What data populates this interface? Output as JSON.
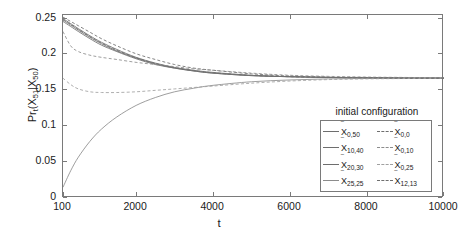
{
  "axes": {
    "xlabel": "t",
    "ylabel_parts": {
      "prefix": "Pr",
      "prefix_sub": "t",
      "open": "(X",
      "n1": "51",
      "bar": "|X",
      "n2": "50",
      "close": ")"
    },
    "ylabel_plain": "Pr_t(X_51|X_50)",
    "xticks": [
      "100",
      "2000",
      "4000",
      "6000",
      "8000",
      "10000"
    ],
    "yticks": [
      "0",
      "0.05",
      "0.1",
      "0.15",
      "0.2",
      "0.25"
    ]
  },
  "legend": {
    "title": "initial configuration",
    "entries": [
      {
        "label": "X",
        "sub": "0,50",
        "style": "solid",
        "color": "#6e6e6e",
        "col": 0,
        "row": 0
      },
      {
        "label": "X",
        "sub": "10,40",
        "style": "solid",
        "color": "#6e6e6e",
        "col": 0,
        "row": 1
      },
      {
        "label": "X",
        "sub": "20,30",
        "style": "solid",
        "color": "#6e6e6e",
        "col": 0,
        "row": 2
      },
      {
        "label": "X",
        "sub": "25,25",
        "style": "solid",
        "color": "#8c8c8c",
        "col": 0,
        "row": 3
      },
      {
        "label": "X",
        "sub": "0,0",
        "style": "dashed",
        "color": "#6e6e6e",
        "col": 1,
        "row": 0
      },
      {
        "label": "X",
        "sub": "0,10",
        "style": "dashed",
        "color": "#8c8c8c",
        "col": 1,
        "row": 1
      },
      {
        "label": "X",
        "sub": "0,25",
        "style": "dashed",
        "color": "#a0a0a0",
        "col": 1,
        "row": 2
      },
      {
        "label": "X",
        "sub": "12,13",
        "style": "dashed",
        "color": "#6e6e6e",
        "col": 1,
        "row": 3
      }
    ]
  },
  "chart_data": {
    "type": "line",
    "title": "",
    "xlabel": "t",
    "ylabel": "Pr_t(X_51|X_50)",
    "xlim": [
      100,
      10000
    ],
    "ylim": [
      0,
      0.255
    ],
    "grid": false,
    "legend_position": "inside-right",
    "legend_title": "initial configuration",
    "converged_value": 0.167,
    "x": [
      100,
      300,
      500,
      800,
      1100,
      1500,
      2000,
      2500,
      3000,
      3500,
      4000,
      5000,
      6000,
      7000,
      8000,
      9000,
      10000
    ],
    "series": [
      {
        "name": "X_0,50",
        "style": "solid",
        "color": "#6e6e6e",
        "values": [
          0.25,
          0.243,
          0.236,
          0.226,
          0.217,
          0.207,
          0.196,
          0.188,
          0.182,
          0.178,
          0.175,
          0.171,
          0.169,
          0.168,
          0.1675,
          0.167,
          0.167
        ]
      },
      {
        "name": "X_10,40",
        "style": "solid",
        "color": "#6e6e6e",
        "values": [
          0.248,
          0.241,
          0.234,
          0.224,
          0.215,
          0.205,
          0.195,
          0.187,
          0.181,
          0.177,
          0.174,
          0.1705,
          0.169,
          0.168,
          0.1675,
          0.167,
          0.167
        ]
      },
      {
        "name": "X_20,30",
        "style": "solid",
        "color": "#6e6e6e",
        "values": [
          0.246,
          0.239,
          0.232,
          0.222,
          0.213,
          0.204,
          0.194,
          0.186,
          0.181,
          0.177,
          0.174,
          0.1705,
          0.169,
          0.168,
          0.1675,
          0.167,
          0.167
        ]
      },
      {
        "name": "X_25,25",
        "style": "solid",
        "color": "#8c8c8c",
        "values": [
          0.015,
          0.038,
          0.057,
          0.079,
          0.096,
          0.113,
          0.129,
          0.14,
          0.148,
          0.153,
          0.157,
          0.162,
          0.1645,
          0.166,
          0.1665,
          0.167,
          0.167
        ]
      },
      {
        "name": "X_0,0",
        "style": "dashed",
        "color": "#6e6e6e",
        "values": [
          0.252,
          0.246,
          0.24,
          0.231,
          0.222,
          0.212,
          0.201,
          0.193,
          0.186,
          0.181,
          0.178,
          0.173,
          0.17,
          0.1685,
          0.168,
          0.1675,
          0.167
        ]
      },
      {
        "name": "X_0,10",
        "style": "dashed",
        "color": "#8c8c8c",
        "values": [
          0.232,
          0.212,
          0.204,
          0.199,
          0.196,
          0.193,
          0.189,
          0.186,
          0.183,
          0.18,
          0.178,
          0.174,
          0.171,
          0.1695,
          0.1685,
          0.168,
          0.1675
        ]
      },
      {
        "name": "X_0,25",
        "style": "dashed",
        "color": "#a0a0a0",
        "values": [
          0.167,
          0.158,
          0.152,
          0.148,
          0.147,
          0.147,
          0.148,
          0.15,
          0.152,
          0.154,
          0.156,
          0.16,
          0.163,
          0.165,
          0.166,
          0.1665,
          0.167
        ]
      },
      {
        "name": "X_12,13",
        "style": "dashed",
        "color": "#6e6e6e",
        "values": [
          0.249,
          0.242,
          0.235,
          0.225,
          0.216,
          0.206,
          0.1955,
          0.1875,
          0.1815,
          0.1775,
          0.1745,
          0.1708,
          0.169,
          0.168,
          0.1675,
          0.167,
          0.167
        ]
      }
    ]
  }
}
